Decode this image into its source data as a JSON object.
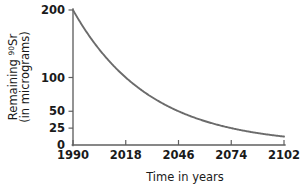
{
  "chart_data": {
    "type": "line",
    "title": "",
    "xlabel": "Time in years",
    "ylabel": "Remaining ⁹⁰Sr (in micrograms)",
    "ylabel_line1": "Remaining",
    "ylabel_superscript": "90",
    "ylabel_element": "Sr",
    "ylabel_line2": "(in micrograms)",
    "grid": false,
    "legend": "none",
    "xlim": [
      1990,
      2102
    ],
    "ylim": [
      0,
      200
    ],
    "xticks": [
      1990,
      2018,
      2046,
      2074,
      2102
    ],
    "xtick_labels": [
      "1990",
      "2018",
      "2046",
      "2074",
      "2102"
    ],
    "yticks": [
      0,
      25,
      50,
      100,
      200
    ],
    "ytick_labels": [
      "0",
      "25",
      "50",
      "100",
      "200"
    ],
    "half_life_years": 28,
    "initial_amount": 200,
    "x": [
      1990,
      1998,
      2006,
      2018,
      2026,
      2034,
      2046,
      2054,
      2062,
      2074,
      2082,
      2090,
      2102
    ],
    "y": [
      200,
      163.2,
      133.2,
      100,
      81.6,
      66.6,
      50,
      40.8,
      33.3,
      25,
      20.4,
      16.7,
      12.5
    ],
    "series": [
      {
        "name": "Remaining Strontium-90",
        "color": "#6b6b6b",
        "values": [
          200,
          163.2,
          133.2,
          100,
          81.6,
          66.6,
          50,
          40.8,
          33.3,
          25,
          20.4,
          16.7,
          12.5
        ]
      }
    ],
    "annotations": []
  },
  "colors": {
    "curve": "#6b6b6b",
    "axis": "#5f5f5f",
    "text": "#1a1a1a",
    "background": "#ffffff"
  }
}
